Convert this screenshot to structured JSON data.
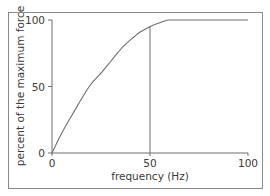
{
  "chart_data": {
    "type": "line",
    "title": "",
    "xlabel": "frequency (Hz)",
    "ylabel": "percent of the maximum force",
    "xlim": [
      0,
      100
    ],
    "ylim": [
      0,
      100
    ],
    "xticks": [
      0,
      50,
      100
    ],
    "yticks": [
      0,
      50,
      100
    ],
    "x_tick_labels": [
      "0",
      "50",
      "100"
    ],
    "y_tick_labels": [
      "0",
      "50",
      "100"
    ],
    "grid": false,
    "legend": null,
    "series": [
      {
        "name": "force-frequency curve",
        "x": [
          0,
          5,
          10,
          19,
          25,
          30,
          35,
          40,
          45,
          50,
          55,
          58,
          60,
          70,
          80,
          90,
          100
        ],
        "values": [
          0,
          15,
          28,
          50,
          60,
          69,
          78,
          85,
          91,
          95,
          98,
          99.5,
          100,
          100,
          100,
          100,
          100
        ]
      }
    ],
    "annotations": [
      {
        "type": "vertical-line",
        "x": 50,
        "from_y": 0,
        "to_y": 95
      }
    ]
  }
}
